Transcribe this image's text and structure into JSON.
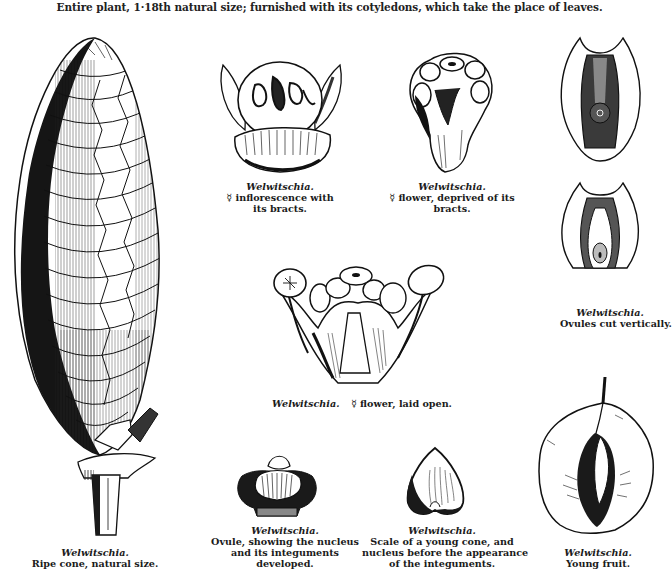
{
  "header": {
    "text": "Entire plant, 1·18th natural size; furnished with its cotyledons, which take the place of leaves."
  },
  "figures": [
    {
      "id": "ripe-cone",
      "genus": "Welwitschia.",
      "lines": [
        "Ripe cone, natural size."
      ]
    },
    {
      "id": "inflorescence",
      "genus": "Welwitschia.",
      "lines": [
        "☿ inflorescence with",
        "its bracts."
      ]
    },
    {
      "id": "flower-deprived",
      "genus": "Welwitschia.",
      "lines": [
        "☿ flower, deprived of its",
        "bracts."
      ]
    },
    {
      "id": "ovules-cut",
      "genus": "Welwitschia.",
      "lines": [
        "Ovules cut vertically."
      ]
    },
    {
      "id": "flower-open",
      "genus": "Welwitschia.",
      "lines": [
        "☿ flower, laid open."
      ]
    },
    {
      "id": "ovule",
      "genus": "Welwitschia.",
      "lines": [
        "Ovule, showing the nucleus",
        "and its integuments",
        "developed."
      ]
    },
    {
      "id": "cone-scale",
      "genus": "Welwitschia.",
      "lines": [
        "Scale of a young cone, and",
        "nucleus before the appearance",
        "of the integuments."
      ]
    },
    {
      "id": "young-fruit",
      "genus": "Welwitschia.",
      "lines": [
        "Young fruit."
      ]
    }
  ],
  "colors": {
    "ink": "#1a1a1a",
    "paper": "#ffffff"
  }
}
